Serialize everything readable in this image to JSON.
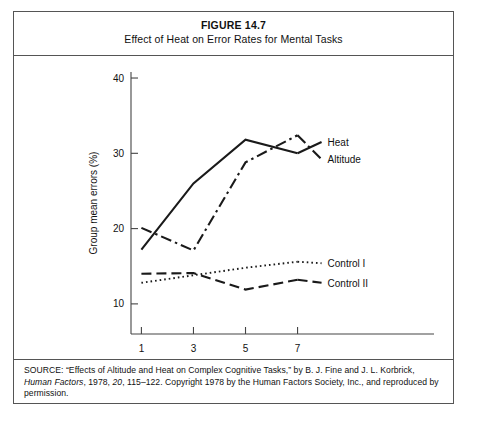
{
  "figure": {
    "number": "FIGURE 14.7",
    "caption": "Effect of Heat on Error Rates for Mental Tasks"
  },
  "source": {
    "prefix": "SOURCE:",
    "text_before_italic": "“Effects of Altitude and Heat on Complex Cognitive Tasks,” by B. J. Fine and J. L. Korbrick, ",
    "italic_journal": "Human Factors",
    "text_after_italic": ", 1978, ",
    "italic_volume": "20",
    "text_tail": ", 115–122. Copyright 1978 by the Human Factors Society, Inc., and reproduced by permission.",
    "full": "SOURCE: “Effects of Altitude and Heat on Complex Cognitive Tasks,” by B. J. Fine and J. L. Korbrick, Human Factors, 1978, 20, 115–122. Copyright 1978 by the Human Factors Society, Inc., and reproduced by permission."
  },
  "chart_data": {
    "type": "line",
    "title": "Effect of Heat on Error Rates for Mental Tasks",
    "xlabel": "Hours of exposure",
    "ylabel": "Group mean errors (%)",
    "x": [
      1,
      3,
      5,
      7
    ],
    "xtick_labels": [
      "1",
      "3",
      "5",
      "7"
    ],
    "ytick_labels": [
      "10",
      "20",
      "30",
      "40"
    ],
    "yticks": [
      10,
      20,
      30,
      40
    ],
    "xlim": [
      0.6,
      8.4
    ],
    "ylim": [
      6.0,
      40.8
    ],
    "grid": false,
    "legend_position": "right-of-line-ends",
    "series": [
      {
        "name": "Heat",
        "style": "solid",
        "color": "#1a1a1a",
        "values": [
          17.2,
          26.0,
          31.8,
          30.0
        ],
        "label_y": 31.5
      },
      {
        "name": "Altitude",
        "style": "dash-dot",
        "color": "#1a1a1a",
        "values": [
          20.1,
          17.1,
          28.8,
          32.4
        ],
        "label_y": 29.2
      },
      {
        "name": "Control I",
        "style": "dotted",
        "color": "#1a1a1a",
        "values": [
          12.8,
          13.8,
          14.8,
          15.6
        ],
        "label_y": 15.4
      },
      {
        "name": "Control II",
        "style": "dashed",
        "color": "#1a1a1a",
        "values": [
          14.0,
          14.1,
          11.9,
          13.2
        ],
        "label_y": 12.8
      }
    ]
  }
}
